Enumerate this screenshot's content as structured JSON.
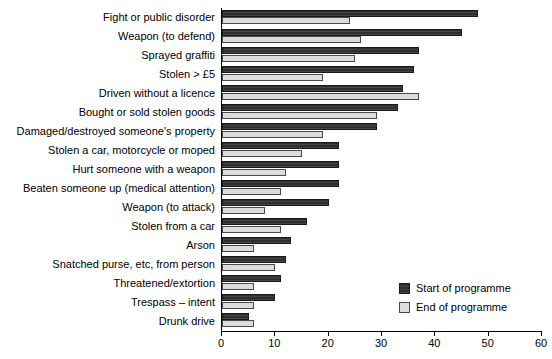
{
  "chart_data": {
    "type": "bar",
    "orientation": "horizontal",
    "title": "",
    "xlabel": "",
    "ylabel": "",
    "xlim": [
      0,
      60
    ],
    "xticks": [
      0,
      10,
      20,
      30,
      40,
      50,
      60
    ],
    "grid": false,
    "legend_position": "bottom-right",
    "categories": [
      "Fight or public disorder",
      "Weapon (to defend)",
      "Sprayed graffiti",
      "Stolen > £5",
      "Driven without a licence",
      "Bought or sold stolen goods",
      "Damaged/destroyed someone's property",
      "Stolen a car, motorcycle or moped",
      "Hurt someone with a weapon",
      "Beaten someone up (medical attention)",
      "Weapon (to attack)",
      "Stolen from a car",
      "Arson",
      "Snatched purse, etc, from person",
      "Threatened/extortion",
      "Trespass – intent",
      "Drunk drive"
    ],
    "series": [
      {
        "name": "Start of programme",
        "color": "#2f2f2f",
        "values": [
          48,
          45,
          37,
          36,
          34,
          33,
          29,
          22,
          22,
          22,
          20,
          16,
          13,
          12,
          11,
          10,
          5
        ]
      },
      {
        "name": "End of programme",
        "color": "#dcdcdc",
        "values": [
          24,
          26,
          25,
          19,
          37,
          29,
          19,
          15,
          12,
          11,
          8,
          11,
          6,
          10,
          6,
          6,
          6
        ]
      }
    ]
  },
  "legend": {
    "items": [
      {
        "label": "Start of programme"
      },
      {
        "label": "End of programme"
      }
    ]
  }
}
